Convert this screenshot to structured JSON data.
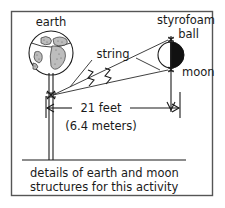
{
  "figure": {
    "labels": {
      "earth": "earth",
      "styrofoam": "styrofoam",
      "ball": "ball",
      "moon": "moon",
      "string": "string"
    },
    "dimension": {
      "feet": "21 feet",
      "meters": "(6.4 meters)"
    },
    "caption": {
      "line1": "details of earth and moon",
      "line2": "structures for this activity"
    },
    "colors": {
      "ink": "#1a1a1a",
      "frame": "#555555",
      "paper": "#ffffff",
      "shadow": "#111111"
    }
  }
}
